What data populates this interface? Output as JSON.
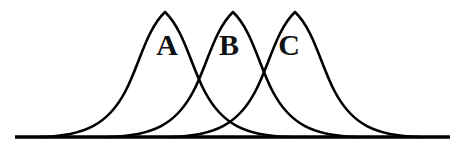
{
  "figure": {
    "background_color": "#ffffff",
    "line_color": "#000000",
    "label_color": "#111111",
    "width": 467,
    "height": 152
  },
  "axis": {
    "name": "baseline",
    "x_start": 15,
    "x_end": 450,
    "y": 137,
    "stroke_width": 3.4
  },
  "labels": {
    "a": "A",
    "b": "B",
    "c": "C"
  },
  "chart_data": {
    "type": "line",
    "title": "",
    "xlabel": "",
    "ylabel": "",
    "grid": false,
    "legend": "inline-annotations",
    "baseline_y": 137,
    "curve_count": 3,
    "series": [
      {
        "name": "A",
        "label": "A",
        "peak_x": 165,
        "peak_y": 12,
        "left_tail_x": 40,
        "right_tail_x": 290,
        "amplitude": 125,
        "path": "M 40 137 C 85 136 108 124 125 92 C 139 66 146 30 165 12 C 184 30 191 66 205 92 C 222 124 245 136 290 137"
      },
      {
        "name": "B",
        "label": "B",
        "peak_x": 233,
        "peak_y": 12,
        "left_tail_x": 108,
        "right_tail_x": 358,
        "amplitude": 125,
        "path": "M 108 137 C 153 136 176 124 193 92 C 207 66 214 30 233 12 C 252 30 259 66 273 92 C 290 124 313 136 358 137"
      },
      {
        "name": "C",
        "label": "C",
        "peak_x": 295,
        "peak_y": 12,
        "left_tail_x": 170,
        "right_tail_x": 420,
        "amplitude": 125,
        "path": "M 170 137 C 215 136 238 124 255 92 C 269 66 276 30 295 12 C 314 30 321 66 335 92 C 352 124 375 136 420 137"
      }
    ],
    "annotations": [
      {
        "text": "A",
        "x": 167,
        "y": 55
      },
      {
        "text": "B",
        "x": 229,
        "y": 55
      },
      {
        "text": "C",
        "x": 289,
        "y": 55
      }
    ],
    "intersections": [
      {
        "between": "A-B",
        "x": 198,
        "y": 32
      },
      {
        "between": "B-C",
        "x": 258,
        "y": 32
      },
      {
        "between": "A-C",
        "x": 228,
        "y": 95
      }
    ]
  }
}
